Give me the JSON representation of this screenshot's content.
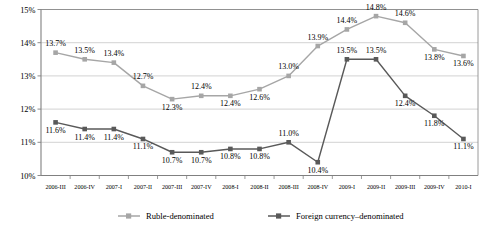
{
  "chart_data": {
    "type": "line",
    "title": "",
    "xlabel": "",
    "ylabel": "",
    "ylim": [
      10,
      15
    ],
    "ytick_values": [
      10,
      11,
      12,
      13,
      14,
      15
    ],
    "ytick_labels": [
      "10%",
      "11%",
      "12%",
      "13%",
      "14%",
      "15%"
    ],
    "grid": true,
    "legend_position": "bottom",
    "categories": [
      "2006-III",
      "2006-IV",
      "2007-I",
      "2007-II",
      "2007-III",
      "2007-IV",
      "2008-I",
      "2008-II",
      "2008-III",
      "2008-IV",
      "2009-I",
      "2009-II",
      "2009-III",
      "2009-IV",
      "2010-I"
    ],
    "series": [
      {
        "name": "Ruble-denominated",
        "color": "#a6a6a6",
        "marker": "square",
        "values": [
          13.7,
          13.5,
          13.4,
          12.7,
          12.3,
          12.4,
          12.4,
          12.6,
          13.0,
          13.9,
          14.4,
          14.8,
          14.6,
          13.8,
          13.6
        ],
        "labels": [
          "13.7%",
          "13.5%",
          "13.4%",
          "12.7%",
          "12.3%",
          "12.4%",
          "12.4%",
          "12.6%",
          "13.0%",
          "13.9%",
          "14.4%",
          "14.8%",
          "14.6%",
          "13.8%",
          "13.6%"
        ],
        "label_positions": [
          "above",
          "above",
          "above",
          "above",
          "below",
          "above",
          "below",
          "below",
          "above",
          "above",
          "above",
          "above",
          "above",
          "below",
          "below"
        ]
      },
      {
        "name": "Foreign currency–denominated",
        "color": "#595959",
        "marker": "square",
        "values": [
          11.6,
          11.4,
          11.4,
          11.1,
          10.7,
          10.7,
          10.8,
          10.8,
          11.0,
          10.4,
          13.5,
          13.5,
          12.4,
          11.8,
          11.1
        ],
        "labels": [
          "11.6%",
          "11.4%",
          "11.4%",
          "11.1%",
          "10.7%",
          "10.7%",
          "10.8%",
          "10.8%",
          "11.0%",
          "10.4%",
          "13.5%",
          "13.5%",
          "12.4%",
          "11.8%",
          "11.1%"
        ],
        "label_positions": [
          "below",
          "below",
          "below",
          "below",
          "below",
          "below",
          "below",
          "below",
          "above",
          "below",
          "above",
          "above",
          "below",
          "below",
          "below"
        ]
      }
    ]
  },
  "legend": {
    "items": [
      {
        "label": "Ruble-denominated",
        "color": "#a6a6a6"
      },
      {
        "label": "Foreign currency–denominated",
        "color": "#595959"
      }
    ]
  }
}
